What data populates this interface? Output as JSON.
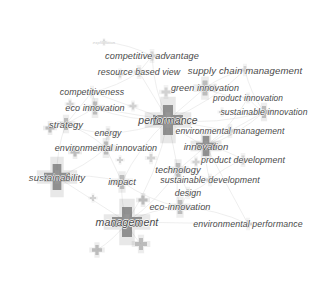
{
  "visualization": {
    "type": "bibliometric-network-map",
    "tool_style": "VOSviewer density/network overlay",
    "width": 328,
    "height": 288,
    "background_color": "#ffffff",
    "node_shape": "plus-cross",
    "node_color_dark": "#6e6e6e",
    "node_color_mid": "#8f8f8f",
    "node_color_light": "#b5b5b5",
    "edge_color": "#e2e2e2",
    "label_color": "#4a4a4a",
    "label_style": "italic"
  },
  "chart_data": {
    "type": "scatter",
    "title": "",
    "xlabel": "",
    "ylabel": "",
    "grid": false,
    "legend": "none",
    "xlim": [
      0,
      328
    ],
    "ylim": [
      0,
      288
    ],
    "nodes": [
      {
        "label": "exploitation",
        "x": 104,
        "y": 42,
        "size": 5,
        "weight": 1,
        "tone": "light",
        "faint": true,
        "font_size": 4.2,
        "label_dx": 0,
        "label_dy": 0
      },
      {
        "label": "competitive advantage",
        "x": 152,
        "y": 56,
        "size": 9,
        "weight": 3,
        "tone": "light",
        "faint": false,
        "font_size": 9.2,
        "label_dx": 0,
        "label_dy": 0
      },
      {
        "label": "resource based view",
        "x": 139,
        "y": 72,
        "size": 9,
        "weight": 3,
        "tone": "light",
        "faint": false,
        "font_size": 8.8,
        "label_dx": 0,
        "label_dy": 0
      },
      {
        "label": "supply chain management",
        "x": 245,
        "y": 70,
        "size": 8,
        "weight": 3,
        "tone": "light",
        "faint": false,
        "font_size": 9.6,
        "label_dx": 0,
        "label_dy": 0
      },
      {
        "label": "green innovation",
        "x": 205,
        "y": 88,
        "size": 15,
        "weight": 6,
        "tone": "mid",
        "faint": false,
        "font_size": 9.0,
        "label_dx": 0,
        "label_dy": 0
      },
      {
        "label": "competitiveness",
        "x": 92,
        "y": 92,
        "size": 8,
        "weight": 3,
        "tone": "light",
        "faint": false,
        "font_size": 8.8,
        "label_dx": 0,
        "label_dy": 0
      },
      {
        "label": "product innovation",
        "x": 248,
        "y": 98,
        "size": 7,
        "weight": 2,
        "tone": "light",
        "faint": false,
        "font_size": 8.4,
        "label_dx": 0,
        "label_dy": 0
      },
      {
        "label": "eco innovation",
        "x": 95,
        "y": 108,
        "size": 13,
        "weight": 5,
        "tone": "mid",
        "faint": false,
        "font_size": 9.0,
        "label_dx": 0,
        "label_dy": 0
      },
      {
        "label": "sustainable innovation",
        "x": 264,
        "y": 112,
        "size": 12,
        "weight": 4,
        "tone": "mid",
        "faint": false,
        "font_size": 8.6,
        "label_dx": 0,
        "label_dy": 0
      },
      {
        "label": "strategy",
        "x": 66,
        "y": 124,
        "size": 12,
        "weight": 5,
        "tone": "mid",
        "faint": false,
        "font_size": 9.4,
        "label_dx": 0,
        "label_dy": 0
      },
      {
        "label": "performance",
        "x": 168,
        "y": 120,
        "size": 30,
        "weight": 12,
        "tone": "dark",
        "faint": false,
        "font_size": 10.4,
        "label_dx": 0,
        "label_dy": 0
      },
      {
        "label": "environmental management",
        "x": 230,
        "y": 131,
        "size": 9,
        "weight": 3,
        "tone": "light",
        "faint": false,
        "font_size": 8.6,
        "label_dx": 0,
        "label_dy": 0
      },
      {
        "label": "energy",
        "x": 108,
        "y": 133,
        "size": 9,
        "weight": 3,
        "tone": "light",
        "faint": false,
        "font_size": 8.6,
        "label_dx": 0,
        "label_dy": 0
      },
      {
        "label": "innovation",
        "x": 206,
        "y": 146,
        "size": 20,
        "weight": 9,
        "tone": "dark",
        "faint": false,
        "font_size": 9.6,
        "label_dx": 0,
        "label_dy": 0
      },
      {
        "label": "environmental innovation",
        "x": 106,
        "y": 148,
        "size": 13,
        "weight": 5,
        "tone": "mid",
        "faint": false,
        "font_size": 9.0,
        "label_dx": 0,
        "label_dy": 0
      },
      {
        "label": "product development",
        "x": 243,
        "y": 160,
        "size": 9,
        "weight": 3,
        "tone": "light",
        "faint": false,
        "font_size": 8.8,
        "label_dx": 0,
        "label_dy": 0
      },
      {
        "label": "technology",
        "x": 178,
        "y": 170,
        "size": 14,
        "weight": 6,
        "tone": "mid",
        "faint": false,
        "font_size": 9.2,
        "label_dx": 0,
        "label_dy": 0
      },
      {
        "label": "sustainability",
        "x": 57,
        "y": 177,
        "size": 26,
        "weight": 11,
        "tone": "dark",
        "faint": false,
        "font_size": 9.6,
        "label_dx": 0,
        "label_dy": 0
      },
      {
        "label": "impact",
        "x": 122,
        "y": 182,
        "size": 14,
        "weight": 6,
        "tone": "mid",
        "faint": false,
        "font_size": 9.2,
        "label_dx": 0,
        "label_dy": 0
      },
      {
        "label": "sustainable development",
        "x": 210,
        "y": 180,
        "size": 8,
        "weight": 3,
        "tone": "light",
        "faint": false,
        "font_size": 8.8,
        "label_dx": 0,
        "label_dy": 0
      },
      {
        "label": "design",
        "x": 188,
        "y": 193,
        "size": 8,
        "weight": 3,
        "tone": "light",
        "faint": false,
        "font_size": 8.8,
        "label_dx": 0,
        "label_dy": 0
      },
      {
        "label": "eco-innovation",
        "x": 180,
        "y": 207,
        "size": 14,
        "weight": 6,
        "tone": "mid",
        "faint": false,
        "font_size": 9.2,
        "label_dx": 0,
        "label_dy": 0
      },
      {
        "label": "management",
        "x": 127,
        "y": 222,
        "size": 30,
        "weight": 12,
        "tone": "dark",
        "faint": false,
        "font_size": 10.6,
        "label_dx": 0,
        "label_dy": 0
      },
      {
        "label": "environmental performance",
        "x": 248,
        "y": 224,
        "size": 8,
        "weight": 3,
        "tone": "light",
        "faint": false,
        "font_size": 8.8,
        "label_dx": 0,
        "label_dy": 0
      }
    ],
    "unlabeled_nodes": [
      {
        "x": 120,
        "y": 74,
        "size": 7,
        "tone": "light"
      },
      {
        "x": 166,
        "y": 92,
        "size": 9,
        "tone": "light"
      },
      {
        "x": 70,
        "y": 104,
        "size": 7,
        "tone": "light"
      },
      {
        "x": 133,
        "y": 106,
        "size": 7,
        "tone": "light"
      },
      {
        "x": 50,
        "y": 128,
        "size": 9,
        "tone": "mid"
      },
      {
        "x": 75,
        "y": 152,
        "size": 9,
        "tone": "mid"
      },
      {
        "x": 151,
        "y": 158,
        "size": 8,
        "tone": "light"
      },
      {
        "x": 120,
        "y": 160,
        "size": 6,
        "tone": "light"
      },
      {
        "x": 222,
        "y": 112,
        "size": 6,
        "tone": "light"
      },
      {
        "x": 196,
        "y": 162,
        "size": 7,
        "tone": "light"
      },
      {
        "x": 93,
        "y": 198,
        "size": 6,
        "tone": "light"
      },
      {
        "x": 143,
        "y": 200,
        "size": 9,
        "tone": "mid"
      },
      {
        "x": 141,
        "y": 244,
        "size": 12,
        "tone": "mid"
      },
      {
        "x": 97,
        "y": 250,
        "size": 10,
        "tone": "mid"
      },
      {
        "x": 215,
        "y": 88,
        "size": 6,
        "tone": "light"
      }
    ],
    "edges": [
      [
        104,
        42,
        152,
        56
      ],
      [
        152,
        56,
        139,
        72
      ],
      [
        152,
        56,
        168,
        120
      ],
      [
        139,
        72,
        92,
        92
      ],
      [
        139,
        72,
        168,
        120
      ],
      [
        245,
        70,
        205,
        88
      ],
      [
        245,
        70,
        168,
        120
      ],
      [
        205,
        88,
        168,
        120
      ],
      [
        205,
        88,
        248,
        98
      ],
      [
        92,
        92,
        95,
        108
      ],
      [
        92,
        92,
        66,
        124
      ],
      [
        248,
        98,
        264,
        112
      ],
      [
        248,
        98,
        206,
        146
      ],
      [
        95,
        108,
        66,
        124
      ],
      [
        95,
        108,
        168,
        120
      ],
      [
        264,
        112,
        206,
        146
      ],
      [
        264,
        112,
        230,
        131
      ],
      [
        66,
        124,
        108,
        133
      ],
      [
        66,
        124,
        106,
        148
      ],
      [
        168,
        120,
        230,
        131
      ],
      [
        168,
        120,
        206,
        146
      ],
      [
        168,
        120,
        108,
        133
      ],
      [
        168,
        120,
        178,
        170
      ],
      [
        168,
        120,
        122,
        182
      ],
      [
        168,
        120,
        127,
        222
      ],
      [
        230,
        131,
        206,
        146
      ],
      [
        108,
        133,
        106,
        148
      ],
      [
        206,
        146,
        243,
        160
      ],
      [
        206,
        146,
        178,
        170
      ],
      [
        206,
        146,
        210,
        180
      ],
      [
        106,
        148,
        57,
        177
      ],
      [
        106,
        148,
        122,
        182
      ],
      [
        243,
        160,
        210,
        180
      ],
      [
        178,
        170,
        210,
        180
      ],
      [
        178,
        170,
        188,
        193
      ],
      [
        178,
        170,
        180,
        207
      ],
      [
        57,
        177,
        122,
        182
      ],
      [
        57,
        177,
        127,
        222
      ],
      [
        122,
        182,
        127,
        222
      ],
      [
        210,
        180,
        188,
        193
      ],
      [
        188,
        193,
        180,
        207
      ],
      [
        180,
        207,
        127,
        222
      ],
      [
        180,
        207,
        248,
        224
      ],
      [
        127,
        222,
        248,
        224
      ],
      [
        127,
        222,
        141,
        244
      ],
      [
        127,
        222,
        97,
        250
      ],
      [
        168,
        120,
        95,
        108
      ],
      [
        168,
        120,
        264,
        112
      ],
      [
        57,
        177,
        66,
        124
      ],
      [
        206,
        146,
        248,
        224
      ],
      [
        122,
        182,
        180,
        207
      ],
      [
        178,
        170,
        127,
        222
      ],
      [
        92,
        92,
        168,
        120
      ],
      [
        245,
        70,
        264,
        112
      ]
    ]
  }
}
